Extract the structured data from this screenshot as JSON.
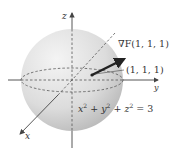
{
  "diagram": {
    "axes": {
      "x_label": "x",
      "y_label": "y",
      "z_label": "z"
    },
    "gradient_label": "∇F(1, 1, 1)",
    "point_label": "(1, 1, 1)",
    "equation": {
      "text": "x² + y² + z² = 3",
      "parts": [
        "x",
        "2",
        " + ",
        "y",
        "2",
        " + ",
        "z",
        "2",
        " = 3"
      ]
    },
    "colors": {
      "sphere_light": "#f2f2f2",
      "sphere_dark": "#b8b8b8",
      "axis": "#444444",
      "arrow": "#222222",
      "dashed": "#555555"
    }
  }
}
